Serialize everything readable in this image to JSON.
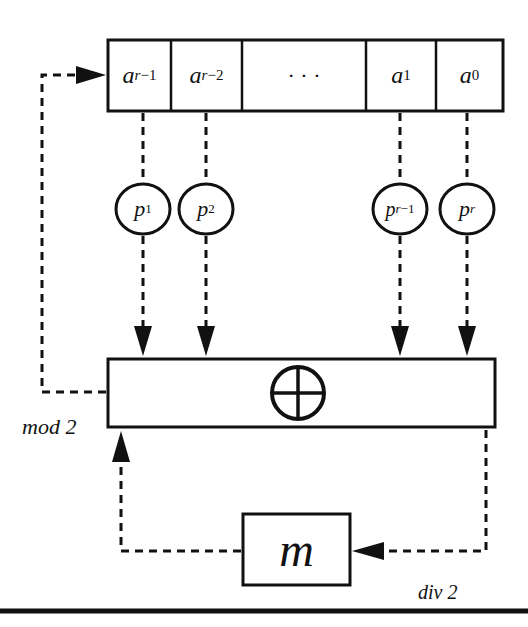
{
  "diagram": {
    "type": "shift-register / feedback circuit",
    "register": {
      "cells": [
        {
          "base": "a",
          "sub_var": "r",
          "sub_rest": "−1"
        },
        {
          "base": "a",
          "sub_var": "r",
          "sub_rest": "−2"
        },
        {
          "base": "· · ·",
          "sub_var": "",
          "sub_rest": ""
        },
        {
          "base": "a",
          "sub_var": "",
          "sub_rest": "1"
        },
        {
          "base": "a",
          "sub_var": "",
          "sub_rest": "0"
        }
      ]
    },
    "coefficients": [
      {
        "base": "p",
        "sub_var": "",
        "sub_rest": "1"
      },
      {
        "base": "p",
        "sub_var": "",
        "sub_rest": "2"
      },
      {
        "base": "p",
        "sub_var": "r",
        "sub_rest": "−1"
      },
      {
        "base": "p",
        "sub_var": "r",
        "sub_rest": "0"
      }
    ],
    "coefficient_last": {
      "base": "p",
      "sub_var": "r",
      "sub_rest": ""
    },
    "adder": {
      "symbol": "⊕"
    },
    "labels": {
      "mod": "mod 2",
      "div": "div 2",
      "memory": "m"
    },
    "colors": {
      "stroke": "#111111",
      "background": "#ffffff"
    }
  }
}
